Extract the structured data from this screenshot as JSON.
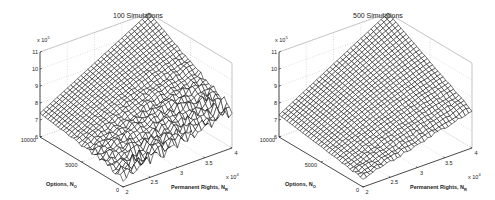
{
  "chart_data": [
    {
      "type": "surface",
      "title": "100 Simulations",
      "xlabel": "Permanent Rights, N",
      "xlabel_sub": "R",
      "ylabel": "Options, N",
      "ylabel_sub": "O",
      "zlabel": "",
      "x_multiplier": "x 10",
      "x_multiplier_exp": "4",
      "z_multiplier": "x 10",
      "z_multiplier_exp": "5",
      "x_ticks": [
        "2",
        "2.5",
        "3",
        "3.5",
        "4"
      ],
      "y_ticks": [
        "0",
        "5000",
        "10000"
      ],
      "z_ticks": [
        "6",
        "7",
        "8",
        "9",
        "10",
        "11"
      ],
      "xlim": [
        2,
        4
      ],
      "ylim": [
        0,
        10000
      ],
      "zlim": [
        6,
        11
      ],
      "grid": true,
      "noise": 0.35,
      "corner_values": {
        "x2_y0": 6.6,
        "x4_y0": 8.2,
        "x2_y10000": 7.4,
        "x4_y10000": 11.0
      }
    },
    {
      "type": "surface",
      "title": "500 Simulations",
      "xlabel": "Permanent Rights, N",
      "xlabel_sub": "R",
      "ylabel": "Options, N",
      "ylabel_sub": "O",
      "zlabel": "",
      "x_multiplier": "x 10",
      "x_multiplier_exp": "4",
      "z_multiplier": "x 10",
      "z_multiplier_exp": "5",
      "x_ticks": [
        "2",
        "2.5",
        "3",
        "3.5",
        "4"
      ],
      "y_ticks": [
        "0",
        "5000",
        "10000"
      ],
      "z_ticks": [
        "6",
        "7",
        "8",
        "9",
        "10",
        "11"
      ],
      "xlim": [
        2,
        4
      ],
      "ylim": [
        0,
        10000
      ],
      "zlim": [
        6,
        11
      ],
      "grid": true,
      "noise": 0.08,
      "corner_values": {
        "x2_y0": 6.5,
        "x4_y0": 8.2,
        "x2_y10000": 7.3,
        "x4_y10000": 11.0
      }
    }
  ]
}
